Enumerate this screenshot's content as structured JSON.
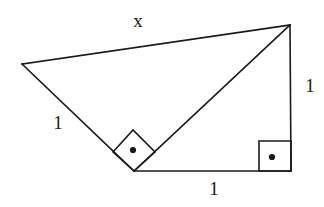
{
  "figure": {
    "background_color": "#ffffff",
    "stroke_color": "#1a1a1a",
    "stroke_width": 1.6,
    "width": 324,
    "height": 207
  },
  "vertices": {
    "left": {
      "name": "left-vertex",
      "x": 22,
      "y": 64
    },
    "top_right": {
      "name": "top-right-vertex",
      "x": 290,
      "y": 25
    },
    "bottom_left": {
      "name": "bottom-middle-vertex",
      "x": 134,
      "y": 171
    },
    "bottom_right": {
      "name": "bottom-right-vertex",
      "x": 291,
      "y": 171
    }
  },
  "edges": [
    {
      "name": "top-edge",
      "label": "x",
      "from": "left",
      "to": "top_right",
      "points": "22,64 290,25"
    },
    {
      "name": "left-edge",
      "label": "1",
      "from": "left",
      "to": "bottom_left",
      "points": "22,64 134,171"
    },
    {
      "name": "diagonal-edge",
      "label": "",
      "from": "bottom_left",
      "to": "top_right",
      "points": "134,171 290,25"
    },
    {
      "name": "bottom-edge",
      "label": "1",
      "from": "bottom_left",
      "to": "bottom_right",
      "points": "134,171 291,171"
    },
    {
      "name": "right-edge",
      "label": "1",
      "from": "top_right",
      "to": "bottom_right",
      "points": "290,25 291,171"
    }
  ],
  "labels": {
    "top": {
      "text": "x",
      "x": 138,
      "y": 20
    },
    "left": {
      "text": "1",
      "x": 58,
      "y": 122
    },
    "right": {
      "text": "1",
      "x": 310,
      "y": 85
    },
    "bottom": {
      "text": "1",
      "x": 214,
      "y": 188
    }
  },
  "right_angle_markers": [
    {
      "name": "right-angle-marker-diamond",
      "shape": "diamond",
      "points": "113,152 133,130 155,152 134,171",
      "dot": {
        "x": 133,
        "y": 150,
        "r": 3.1
      }
    },
    {
      "name": "right-angle-marker-square",
      "shape": "square",
      "points": "259,141 291,141 291,171 259,171",
      "dot": {
        "x": 272,
        "y": 157,
        "r": 3.1
      }
    }
  ]
}
